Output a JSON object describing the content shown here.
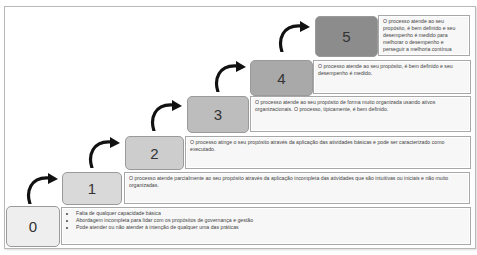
{
  "diagram": {
    "levels": [
      {
        "number": "0",
        "fill": "#eeeeee",
        "description_bullets": [
          "Falta de qualquer capacidade básica",
          "Abordagem incompleta para lidar com os propósitos de governança e gestão",
          "Pode atender ou não atender à intenção de qualquer uma das práticas"
        ]
      },
      {
        "number": "1",
        "fill": "#d9d9d9",
        "description": "O processo atende parcialmente ao seu propósito através da aplicação incompleta das atividades que são intuitivas ou iniciais e não muito organizadas."
      },
      {
        "number": "2",
        "fill": "#cdcdcd",
        "description": "O processo atinge o seu propósito através da aplicação das atividades básicas e pode ser caracterizado como executado."
      },
      {
        "number": "3",
        "fill": "#bdbdbd",
        "description": "O processo atende ao seu propósito de forma muito organizada usando ativos organizacionais. O processo, tipicamente, é bem definido."
      },
      {
        "number": "4",
        "fill": "#a9a9a9",
        "description": "O processo atende ao seu propósito, é bem definido e seu desempenho é medido."
      },
      {
        "number": "5",
        "fill": "#8c8c8c",
        "description": "O processo atende ao seu propósito, é bem definido e seu desempenho é medido para melhorar o desempenho e perseguir a melhoria contínua"
      }
    ]
  }
}
